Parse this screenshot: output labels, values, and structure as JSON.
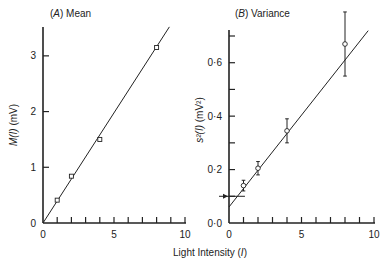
{
  "chart_data": [
    {
      "type": "scatter",
      "panel": "A",
      "title": "(A) Mean",
      "title_letter": "A",
      "title_text": "Mean",
      "xlabel": "Light Intensity (I)",
      "ylabel": "M(I) (mV)",
      "xlim": [
        0,
        10
      ],
      "ylim": [
        0,
        3.5
      ],
      "xticks": [
        0,
        5,
        10
      ],
      "xminor_step": 1,
      "yticks": [
        0,
        1,
        2,
        3
      ],
      "ytick_labels": [
        "0",
        "1",
        "2",
        "3"
      ],
      "grid": false,
      "marker": "square",
      "points": [
        {
          "x": 1,
          "y": 0.41
        },
        {
          "x": 2,
          "y": 0.84
        },
        {
          "x": 4,
          "y": 1.5
        },
        {
          "x": 8,
          "y": 3.15
        }
      ],
      "fit_line": {
        "x0": 0,
        "y0": 0,
        "x1": 8.9,
        "y1": 3.52
      }
    },
    {
      "type": "scatter",
      "panel": "B",
      "title": "(B) Variance",
      "title_letter": "B",
      "title_text": "Variance",
      "xlabel": "Light Intensity (I)",
      "ylabel": "s²(I) (mV²)",
      "xlim": [
        0,
        10
      ],
      "ylim": [
        0,
        0.7
      ],
      "xticks": [
        0,
        5,
        10
      ],
      "xminor_step": 1,
      "yticks": [
        0.0,
        0.2,
        0.4,
        0.6
      ],
      "ytick_labels": [
        "0·0",
        "0·2",
        "0·4",
        "0·6"
      ],
      "yminor_step": 0.1,
      "grid": false,
      "marker": "circle",
      "points": [
        {
          "x": 1,
          "y": 0.14,
          "err_low": 0.12,
          "err_high": 0.16
        },
        {
          "x": 2,
          "y": 0.205,
          "err_low": 0.18,
          "err_high": 0.23
        },
        {
          "x": 4,
          "y": 0.345,
          "err_low": 0.3,
          "err_high": 0.39
        },
        {
          "x": 8,
          "y": 0.67,
          "err_low": 0.55,
          "err_high": 0.79
        }
      ],
      "fit_line": {
        "x0": 0,
        "y0": 0.06,
        "x1": 9.6,
        "y1": 0.72
      },
      "annotation": {
        "type": "arrow",
        "y": 0.1,
        "note": "background variance marker"
      }
    }
  ],
  "shared": {
    "xlabel": "Light Intensity (I)",
    "xlabel_prefix": "Light Intensity (",
    "xlabel_var": "I",
    "xlabel_suffix": ")"
  },
  "labels": {
    "a_ylabel_var": "M(I)",
    "a_ylabel_unit": " (mV)",
    "b_ylabel_var": "s²(I)",
    "b_ylabel_unit": " (mV²)"
  }
}
